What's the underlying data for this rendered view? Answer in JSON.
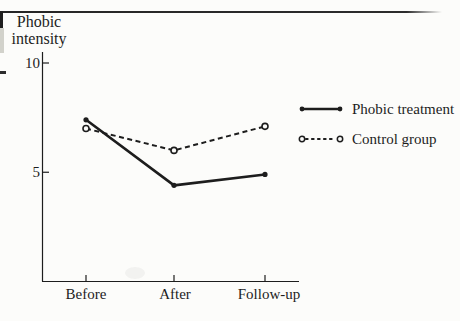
{
  "figure": {
    "background_color": "#fcfcfa",
    "ink_color": "#1d1d1d"
  },
  "chart_data": {
    "type": "line",
    "title": "",
    "ylabel": "Phobic intensity",
    "ylabel_lines": [
      "Phobic",
      "intensity"
    ],
    "categories": [
      "Before",
      "After",
      "Follow-up"
    ],
    "yticks": [
      10,
      5
    ],
    "ylim": [
      0,
      11.5
    ],
    "grid": false,
    "legend_position": "right-center",
    "series": [
      {
        "name": "Phobic treatment",
        "line_style": "solid",
        "marker": "filled-circle",
        "color": "#1d1d1d",
        "values": [
          7.4,
          4.4,
          4.9
        ]
      },
      {
        "name": "Control group",
        "line_style": "dashed",
        "marker": "open-circle",
        "color": "#1d1d1d",
        "values": [
          7.0,
          6.0,
          7.1
        ]
      }
    ]
  }
}
